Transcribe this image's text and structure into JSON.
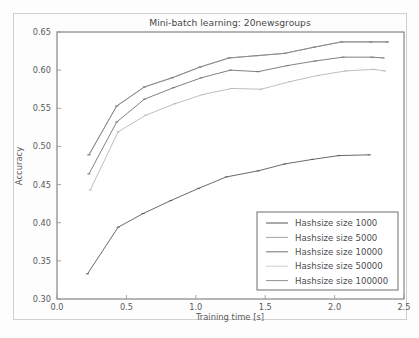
{
  "figure": {
    "title": "Mini-batch learning: 20newsgroups",
    "background_color": "#fdfdfd",
    "frame_color": "#6f6f6f"
  },
  "chart_data": {
    "type": "line",
    "title": "Mini-batch learning: 20newsgroups",
    "xlabel": "Training time [s]",
    "ylabel": "Accuracy",
    "xlim": [
      0.0,
      2.5
    ],
    "ylim": [
      0.3,
      0.65
    ],
    "xticks": [
      "0.0",
      "0.5",
      "1.0",
      "1.5",
      "2.0",
      "2.5"
    ],
    "xtick_values": [
      0.0,
      0.5,
      1.0,
      1.5,
      2.0,
      2.5
    ],
    "yticks": [
      "0.30",
      "0.35",
      "0.40",
      "0.45",
      "0.50",
      "0.55",
      "0.60",
      "0.65"
    ],
    "ytick_values": [
      0.3,
      0.35,
      0.4,
      0.45,
      0.5,
      0.55,
      0.6,
      0.65
    ],
    "grid": false,
    "legend_position": "lower right",
    "series": [
      {
        "name": "Hashsize size 1000",
        "color": "#4f4f4f",
        "x": [
          0.22,
          0.44,
          0.62,
          0.82,
          1.02,
          1.22,
          1.45,
          1.64,
          1.84,
          2.03,
          2.25
        ],
        "y": [
          0.333,
          0.394,
          0.412,
          0.429,
          0.445,
          0.46,
          0.468,
          0.477,
          0.483,
          0.488,
          0.489
        ]
      },
      {
        "name": "Hashsize size 5000",
        "color": "#7d7d7d",
        "x": [
          0.23,
          0.43,
          0.63,
          0.83,
          1.03,
          1.24,
          1.44,
          1.64,
          1.85,
          2.05,
          2.26,
          2.38
        ],
        "y": [
          0.489,
          0.553,
          0.578,
          0.59,
          0.604,
          0.616,
          0.619,
          0.622,
          0.63,
          0.637,
          0.637,
          0.637
        ]
      },
      {
        "name": "Hashsize size 10000",
        "color": "#6a6a6a",
        "x": [
          0.23,
          0.43,
          0.63,
          0.84,
          1.04,
          1.25,
          1.45,
          1.66,
          1.86,
          2.06,
          2.27,
          2.35
        ],
        "y": [
          0.464,
          0.532,
          0.562,
          0.577,
          0.59,
          0.6,
          0.598,
          0.606,
          0.612,
          0.617,
          0.617,
          0.616
        ]
      },
      {
        "name": "Hashsize size 50000",
        "color": "#b4b4b4",
        "x": [
          0.24,
          0.44,
          0.64,
          0.85,
          1.05,
          1.26,
          1.47,
          1.68,
          1.88,
          2.08,
          2.28,
          2.36
        ],
        "y": [
          0.443,
          0.519,
          0.541,
          0.556,
          0.568,
          0.576,
          0.575,
          0.585,
          0.593,
          0.599,
          0.601,
          0.599
        ]
      },
      {
        "name": "Hashsize size 100000",
        "color": "#8c8c8c",
        "x": [
          0.23,
          0.43,
          0.63,
          0.83,
          1.03,
          1.24,
          1.44,
          1.64,
          1.85,
          2.05,
          2.26,
          2.38
        ],
        "y": [
          0.489,
          0.553,
          0.578,
          0.59,
          0.604,
          0.616,
          0.619,
          0.622,
          0.63,
          0.637,
          0.637,
          0.637
        ]
      }
    ]
  },
  "legend": {
    "items": [
      {
        "label": "Hashsize size 1000",
        "color": "#4f4f4f"
      },
      {
        "label": "Hashsize size 5000",
        "color": "#9d9d9d"
      },
      {
        "label": "Hashsize size 10000",
        "color": "#6a6a6a"
      },
      {
        "label": "Hashsize size 50000",
        "color": "#cacaca"
      },
      {
        "label": "Hashsize size 100000",
        "color": "#8c8c8c"
      }
    ]
  }
}
